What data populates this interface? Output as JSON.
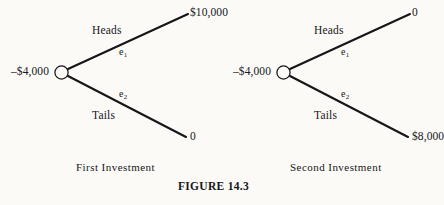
{
  "figure": {
    "caption": "FIGURE 14.3",
    "background_color": "#fbfaf7",
    "ink_color": "#16161a"
  },
  "trees": [
    {
      "id": "first-investment",
      "caption": "First Investment",
      "root_label": "–$4,000",
      "node_icon": "chance-node-circle",
      "branches": [
        {
          "id": "heads",
          "name": "Heads",
          "edge_label": "e",
          "edge_subscript": "1",
          "payoff": "$10,000"
        },
        {
          "id": "tails",
          "name": "Tails",
          "edge_label": "e",
          "edge_subscript": "2",
          "payoff": "0"
        }
      ]
    },
    {
      "id": "second-investment",
      "caption": "Second Investment",
      "root_label": "–$4,000",
      "node_icon": "chance-node-circle",
      "branches": [
        {
          "id": "heads",
          "name": "Heads",
          "edge_label": "e",
          "edge_subscript": "1",
          "payoff": "0"
        },
        {
          "id": "tails",
          "name": "Tails",
          "edge_label": "e",
          "edge_subscript": "2",
          "payoff": "$8,000"
        }
      ]
    }
  ]
}
